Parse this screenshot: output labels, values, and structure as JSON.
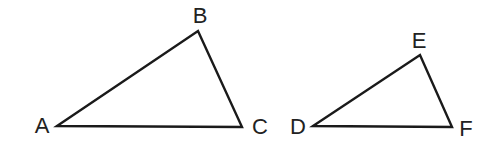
{
  "figure": {
    "triangles": [
      {
        "name": "ABC",
        "vertices": [
          {
            "label": "A",
            "x": 57,
            "y": 126,
            "lx": 42,
            "ly": 127
          },
          {
            "label": "B",
            "x": 198,
            "y": 31,
            "lx": 200,
            "ly": 17
          },
          {
            "label": "C",
            "x": 242,
            "y": 127,
            "lx": 260,
            "ly": 128
          }
        ]
      },
      {
        "name": "DEF",
        "vertices": [
          {
            "label": "D",
            "x": 313,
            "y": 126,
            "lx": 298,
            "ly": 128
          },
          {
            "label": "E",
            "x": 420,
            "y": 55,
            "lx": 419,
            "ly": 42
          },
          {
            "label": "F",
            "x": 452,
            "y": 127,
            "lx": 466,
            "ly": 130
          }
        ]
      }
    ],
    "colors": {
      "line": "#1a1a1a",
      "text": "#222222",
      "background": "#ffffff"
    }
  }
}
